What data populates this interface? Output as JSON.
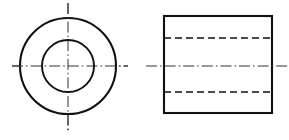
{
  "drawing": {
    "title": "Two-view orthographic drawing of a hollow cylindrical bushing",
    "background_color": "#ffffff",
    "line_color": "#111111",
    "center_line_color": "#333333",
    "canvas": {
      "width": 289,
      "height": 140
    },
    "views": [
      {
        "id": "front-view",
        "name": "Circular end view",
        "type": "circles",
        "center": {
          "x": 68,
          "y": 66
        },
        "outer_circle": {
          "radius": 48,
          "line_type": "visible",
          "stroke_width": 2.1
        },
        "inner_circle": {
          "radius": 26,
          "line_type": "visible",
          "stroke_width": 1.9
        },
        "center_lines": {
          "horizontal": {
            "x1": 12,
            "y1": 66,
            "x2": 128,
            "y2": 66,
            "line_type": "center"
          },
          "vertical": {
            "x1": 68,
            "y1": 3,
            "x2": 68,
            "y2": 131,
            "line_type": "center"
          }
        }
      },
      {
        "id": "side-view",
        "name": "Rectangular side view",
        "type": "rectangle",
        "rect": {
          "x": 164,
          "y": 16,
          "width": 108,
          "height": 97,
          "line_type": "visible",
          "stroke_width": 2.1
        },
        "hidden_lines": [
          {
            "id": "bore-top",
            "x1": 164,
            "y1": 38,
            "x2": 272,
            "y2": 38,
            "line_type": "hidden"
          },
          {
            "id": "bore-bottom",
            "x1": 164,
            "y1": 92,
            "x2": 272,
            "y2": 92,
            "line_type": "hidden"
          }
        ],
        "center_lines": {
          "horizontal": {
            "x1": 146,
            "y1": 66,
            "x2": 289,
            "y2": 66,
            "line_type": "center"
          }
        }
      }
    ],
    "line_type_legend": [
      {
        "key": "visible",
        "label": "Visible outline (continuous thick)"
      },
      {
        "key": "hidden",
        "label": "Hidden edge (dashed)"
      },
      {
        "key": "center",
        "label": "Centre line (chain dash-dot)"
      }
    ]
  }
}
